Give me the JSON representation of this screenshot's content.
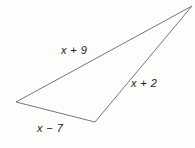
{
  "figure": {
    "type": "triangle",
    "background_color": "#fdfdfc",
    "stroke_color": "#77777a",
    "stroke_width": 1,
    "fill": "none",
    "text_color": "#1b1b1b",
    "canvas": {
      "width": 195,
      "height": 148
    },
    "vertices": [
      {
        "name": "left-vertex",
        "x": 16,
        "y": 102
      },
      {
        "name": "apex-vertex",
        "x": 192,
        "y": 6
      },
      {
        "name": "bottom-right-vertex",
        "x": 95,
        "y": 122
      }
    ],
    "polygon_points": "16,102 192,6 95,122",
    "sides": [
      {
        "name": "top-side",
        "label": "x + 9",
        "from": "left-vertex",
        "to": "apex-vertex",
        "label_x": 61,
        "label_y": 45
      },
      {
        "name": "right-side",
        "label": "x + 2",
        "from": "apex-vertex",
        "to": "bottom-right-vertex",
        "label_x": 131,
        "label_y": 78
      },
      {
        "name": "bottom-side",
        "label": "x − 7",
        "from": "bottom-right-vertex",
        "to": "left-vertex",
        "label_x": 37,
        "label_y": 123
      }
    ]
  }
}
